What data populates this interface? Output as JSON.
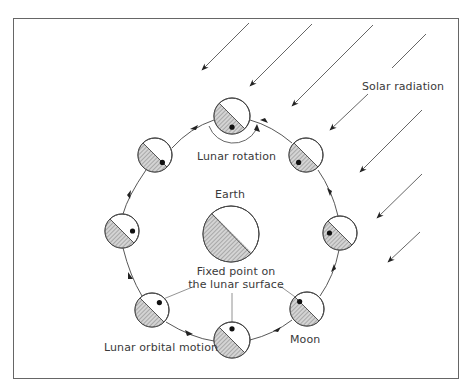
{
  "diagram": {
    "type": "lunar-orbit-synchronous-rotation",
    "colors": {
      "frame": "#555555",
      "line": "#444444",
      "arrow": "#333333",
      "hatch_fill": "#bdbdbd",
      "dot": "#111111",
      "text": "#3a3a3a"
    },
    "labels": {
      "solar_radiation": "Solar radiation",
      "lunar_rotation": "Lunar rotation",
      "earth": "Earth",
      "fixed_point_line1": "Fixed point on",
      "fixed_point_line2": "the lunar surface",
      "lunar_orbital_motion": "Lunar orbital motion",
      "moon": "Moon"
    },
    "earth": {
      "cx": 231,
      "cy": 234,
      "r": 28
    },
    "orbit": {
      "cx": 231,
      "cy": 227,
      "r": 112,
      "direction": "counterclockwise"
    },
    "moons": [
      {
        "position": "top",
        "cx": 232,
        "cy": 116,
        "r": 18,
        "fixed_point": "bottom"
      },
      {
        "position": "upper-right",
        "cx": 306,
        "cy": 155,
        "r": 17,
        "fixed_point": "lower-left"
      },
      {
        "position": "right",
        "cx": 340,
        "cy": 233,
        "r": 17,
        "fixed_point": "left"
      },
      {
        "position": "lower-right",
        "cx": 307,
        "cy": 309,
        "r": 17,
        "fixed_point": "upper-left"
      },
      {
        "position": "bottom",
        "cx": 232,
        "cy": 340,
        "r": 18,
        "fixed_point": "top"
      },
      {
        "position": "lower-left",
        "cx": 152,
        "cy": 310,
        "r": 17,
        "fixed_point": "upper-right"
      },
      {
        "position": "left",
        "cx": 122,
        "cy": 231,
        "r": 17,
        "fixed_point": "right"
      },
      {
        "position": "upper-left",
        "cx": 155,
        "cy": 155,
        "r": 17,
        "fixed_point": "lower-right"
      }
    ],
    "solar_rays": 7
  }
}
